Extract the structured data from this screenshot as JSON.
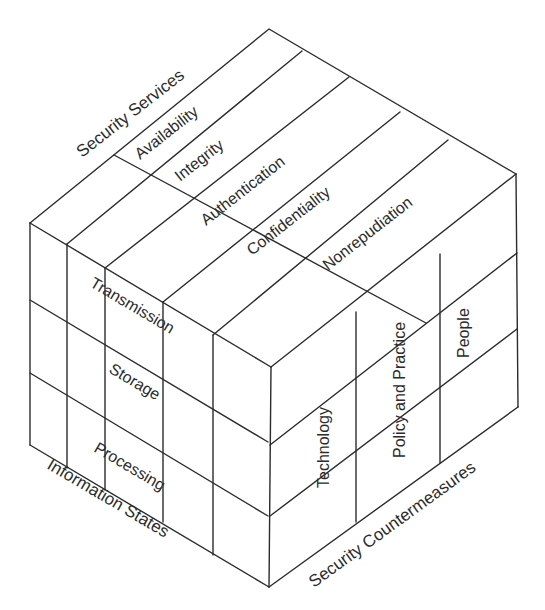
{
  "diagram": {
    "title": "",
    "axes": {
      "security_services": "Security Services",
      "information_states": "Information States",
      "security_countermeasures": "Security Countermeasures"
    },
    "security_services": [
      "Availability",
      "Integrity",
      "Authentication",
      "Confidentiality",
      "Nonrepudiation"
    ],
    "information_states": [
      "Transmission",
      "Storage",
      "Processing"
    ],
    "security_countermeasures": [
      "Technology",
      "Policy and Practice",
      "People"
    ],
    "colors": {
      "line": "#2b2b2b",
      "text": "#2b2b2b",
      "background": "#ffffff"
    }
  }
}
